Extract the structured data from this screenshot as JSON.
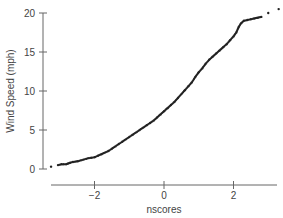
{
  "chart_data": {
    "type": "scatter",
    "title": "",
    "xlabel": "nscores",
    "ylabel": "Wind Speed (mph)",
    "xlim": [
      -3.3,
      3.2
    ],
    "ylim": [
      0,
      20
    ],
    "xticks": [
      -2,
      0,
      2
    ],
    "yticks": [
      0,
      5,
      10,
      15,
      20
    ],
    "grid": false,
    "legend": null,
    "color": "#222222",
    "series": [
      {
        "name": "Wind Speed normal probability plot",
        "points": [
          [
            -3.25,
            0.3
          ],
          [
            -3.05,
            0.5
          ],
          [
            -2.95,
            0.6
          ],
          [
            -2.88,
            0.6
          ],
          [
            -2.82,
            0.6
          ],
          [
            -2.76,
            0.7
          ],
          [
            -2.7,
            0.8
          ],
          [
            -2.62,
            0.9
          ],
          [
            -2.55,
            0.95
          ],
          [
            -2.48,
            1.0
          ],
          [
            -2.4,
            1.1
          ],
          [
            -2.32,
            1.2
          ],
          [
            -2.24,
            1.3
          ],
          [
            -2.16,
            1.4
          ],
          [
            -2.08,
            1.45
          ],
          [
            -2.0,
            1.5
          ],
          [
            -1.9,
            1.7
          ],
          [
            -1.8,
            1.9
          ],
          [
            -1.7,
            2.1
          ],
          [
            -1.6,
            2.3
          ],
          [
            -1.5,
            2.6
          ],
          [
            -1.4,
            2.9
          ],
          [
            -1.3,
            3.2
          ],
          [
            -1.2,
            3.5
          ],
          [
            -1.1,
            3.8
          ],
          [
            -1.0,
            4.1
          ],
          [
            -0.9,
            4.4
          ],
          [
            -0.8,
            4.7
          ],
          [
            -0.7,
            5.0
          ],
          [
            -0.6,
            5.3
          ],
          [
            -0.5,
            5.6
          ],
          [
            -0.4,
            5.9
          ],
          [
            -0.3,
            6.2
          ],
          [
            -0.2,
            6.6
          ],
          [
            -0.1,
            7.0
          ],
          [
            0.0,
            7.4
          ],
          [
            0.1,
            7.8
          ],
          [
            0.2,
            8.2
          ],
          [
            0.3,
            8.6
          ],
          [
            0.4,
            9.1
          ],
          [
            0.5,
            9.6
          ],
          [
            0.6,
            10.1
          ],
          [
            0.7,
            10.6
          ],
          [
            0.8,
            11.1
          ],
          [
            0.9,
            11.8
          ],
          [
            1.0,
            12.4
          ],
          [
            1.1,
            12.9
          ],
          [
            1.2,
            13.5
          ],
          [
            1.3,
            14.0
          ],
          [
            1.4,
            14.4
          ],
          [
            1.5,
            14.8
          ],
          [
            1.6,
            15.2
          ],
          [
            1.7,
            15.6
          ],
          [
            1.8,
            16.0
          ],
          [
            1.9,
            16.5
          ],
          [
            2.0,
            17.0
          ],
          [
            2.08,
            17.5
          ],
          [
            2.15,
            18.2
          ],
          [
            2.22,
            18.7
          ],
          [
            2.3,
            19.0
          ],
          [
            2.4,
            19.1
          ],
          [
            2.5,
            19.2
          ],
          [
            2.6,
            19.3
          ],
          [
            2.7,
            19.4
          ],
          [
            2.8,
            19.5
          ],
          [
            3.0,
            20.0
          ],
          [
            3.3,
            20.5
          ]
        ]
      }
    ]
  }
}
